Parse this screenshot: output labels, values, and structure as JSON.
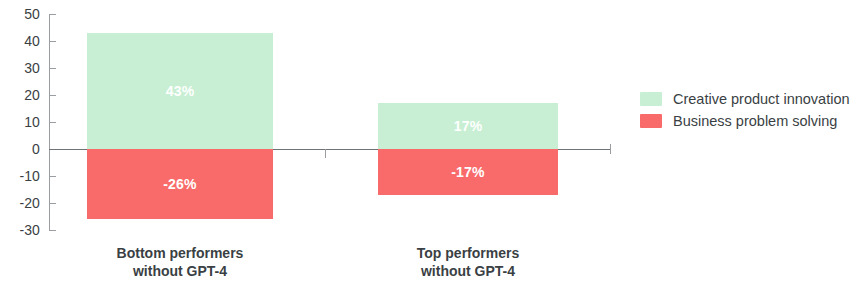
{
  "chart_data": {
    "type": "bar",
    "title": "",
    "subtitle": "",
    "xlabel": "",
    "ylabel": "",
    "ylim": [
      -30,
      50
    ],
    "grid": false,
    "stacked": false,
    "orientation": "vertical",
    "legend_position": "right",
    "y_ticks": [
      {
        "value": 50,
        "label": "50"
      },
      {
        "value": 40,
        "label": "40"
      },
      {
        "value": 30,
        "label": "30"
      },
      {
        "value": 20,
        "label": "20"
      },
      {
        "value": 10,
        "label": "10"
      },
      {
        "value": 0,
        "label": "0"
      },
      {
        "value": -10,
        "label": "-10"
      },
      {
        "value": -20,
        "label": "-20"
      },
      {
        "value": -30,
        "label": "-30"
      }
    ],
    "categories": [
      "Bottom performers without GPT-4",
      "Top performers without GPT-4"
    ],
    "category_lines": [
      [
        "Bottom performers",
        "without GPT-4"
      ],
      [
        "Top performers",
        "without GPT-4"
      ]
    ],
    "series": [
      {
        "name": "Creative product innovation",
        "color": "#c8efd3",
        "values": [
          43,
          17
        ],
        "value_labels": [
          "43%",
          "17%"
        ]
      },
      {
        "name": "Business problem solving",
        "color": "#f96b6b",
        "values": [
          -26,
          -17
        ],
        "value_labels": [
          "-26%",
          "-17%"
        ]
      }
    ]
  },
  "legend": {
    "items": [
      {
        "label": "Creative product innovation",
        "color": "#c8efd3"
      },
      {
        "label": "Business problem solving",
        "color": "#f96b6b"
      }
    ]
  },
  "colors": {
    "positive": "#c8efd3",
    "negative": "#f96b6b",
    "axis": "#9a9ea3",
    "zero_line": "#6f7479",
    "text": "#3a3f44",
    "background": "#ffffff",
    "data_label": "#ffffff"
  }
}
